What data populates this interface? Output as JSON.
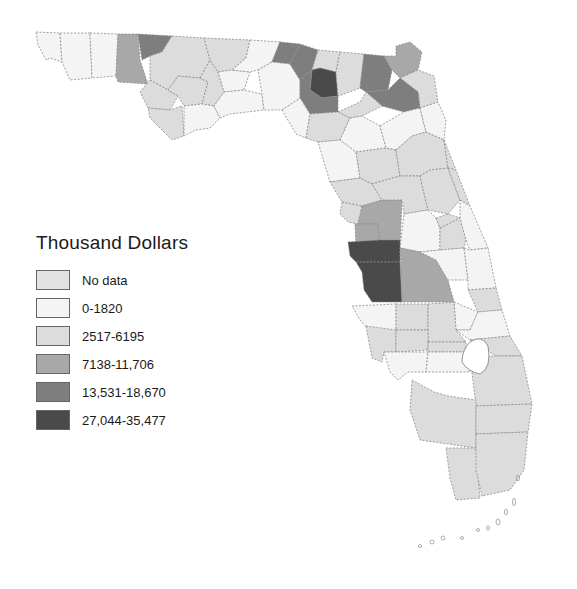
{
  "legend": {
    "title": "Thousand Dollars",
    "items": [
      {
        "label": "No data",
        "color": "#e2e2e2"
      },
      {
        "label": "0-1820",
        "color": "#f4f4f4"
      },
      {
        "label": "2517-6195",
        "color": "#dcdcdc"
      },
      {
        "label": "7138-11,706",
        "color": "#a8a8a8"
      },
      {
        "label": "13,531-18,670",
        "color": "#7e7e7e"
      },
      {
        "label": "27,044-35,477",
        "color": "#4a4a4a"
      }
    ]
  },
  "map": {
    "region": "Florida counties",
    "border_color": "#777777"
  }
}
